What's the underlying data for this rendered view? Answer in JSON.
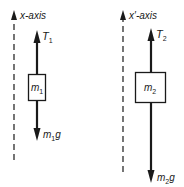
{
  "diagram": {
    "left": {
      "axis_label": "x-axis",
      "mass_symbol": "m",
      "mass_subscript": "1",
      "tension_symbol": "T",
      "tension_subscript": "1",
      "weight_symbol": "m",
      "weight_subscript": "1",
      "weight_suffix": "g"
    },
    "right": {
      "axis_label": "x′-axis",
      "mass_symbol": "m",
      "mass_subscript": "2",
      "tension_symbol": "T",
      "tension_subscript": "2",
      "weight_symbol": "m",
      "weight_subscript": "2",
      "weight_suffix": "g"
    },
    "colors": {
      "ink": "#1a1a1a",
      "background": "#ffffff"
    }
  }
}
